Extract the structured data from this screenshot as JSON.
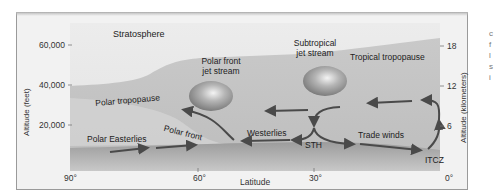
{
  "diagram": {
    "regions": {
      "stratosphere": "Stratosphere"
    },
    "labels": {
      "polar_front_jet": [
        "Polar front",
        "jet stream"
      ],
      "subtropical_jet": [
        "Subtropical",
        "jet stream"
      ],
      "tropical_tropopause": "Tropical tropopause",
      "polar_tropopause": "Polar tropopause",
      "polar_front": "Polar front",
      "polar_easterlies": "Polar Easterlies",
      "westerlies": "Westerlies",
      "sth": "STH",
      "trade_winds": "Trade winds",
      "itcz": "ITCZ"
    },
    "left_axis": {
      "title": "Altitude (feet)",
      "ticks": [
        "60,000",
        "40,000",
        "20,000"
      ]
    },
    "right_axis": {
      "title": "Altitude (kilometers)",
      "ticks": [
        "18",
        "12",
        "6"
      ]
    },
    "bottom_axis": {
      "title": "Latitude",
      "ticks": [
        "90°",
        "60°",
        "30°",
        "0°"
      ]
    },
    "side_fragments": [
      "c",
      "f",
      "l",
      "s",
      "i"
    ],
    "colors": {
      "background": "#f2f2f2",
      "troposphere": "#c4c4c4",
      "stratosphere": "#e8e8e8",
      "surface": "#a8a8a8",
      "arrow": "#4a4a4a",
      "jet": "#9a9a9a"
    }
  }
}
